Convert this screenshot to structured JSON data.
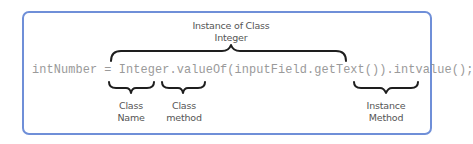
{
  "diagram": {
    "code_line": "intNumber = Integer.valueOf(inputField.getText()).intvalue();",
    "annotations": {
      "top": {
        "line1": "Instance of Class",
        "line2": "Integer"
      },
      "class_name": {
        "line1": "Class",
        "line2": "Name"
      },
      "class_method": {
        "line1": "Class",
        "line2": "method"
      },
      "instance_method": {
        "line1": "Instance",
        "line2": "Method"
      }
    },
    "colors": {
      "border": "#6f8fd8",
      "code_text": "#9a9a9a",
      "label_text": "#555555",
      "brace": "#1e1e1e"
    }
  }
}
